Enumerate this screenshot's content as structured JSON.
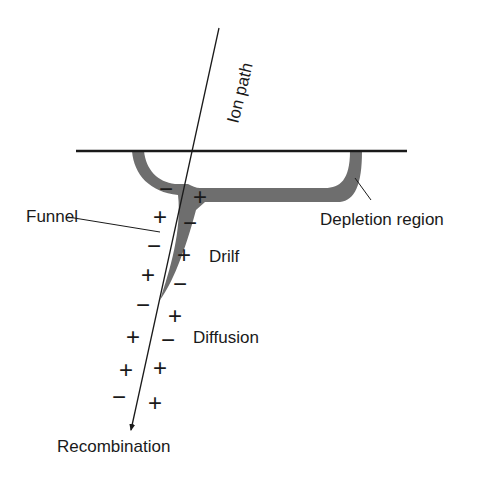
{
  "labels": {
    "ion_path": "Ion path",
    "funnel": "Funnel",
    "depletion_region": "Depletion region",
    "drift": "Drilf",
    "diffusion": "Diffusion",
    "recombination": "Recombination"
  },
  "charges": {
    "plus": "+",
    "minus": "−"
  },
  "colors": {
    "ink": "#1a1a1a",
    "depletion_fill": "#6e6e6e",
    "background": "#ffffff"
  }
}
